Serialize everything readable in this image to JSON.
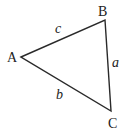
{
  "diagram": {
    "type": "triangle",
    "stroke_color": "#2a2a2a",
    "vertices": [
      {
        "id": "A",
        "label": "A",
        "x": 21,
        "y": 57
      },
      {
        "id": "B",
        "label": "B",
        "x": 105,
        "y": 20
      },
      {
        "id": "C",
        "label": "C",
        "x": 111,
        "y": 111
      }
    ],
    "sides": [
      {
        "id": "c",
        "label": "c",
        "from": "A",
        "to": "B"
      },
      {
        "id": "a",
        "label": "a",
        "from": "B",
        "to": "C"
      },
      {
        "id": "b",
        "label": "b",
        "from": "A",
        "to": "C"
      }
    ]
  }
}
